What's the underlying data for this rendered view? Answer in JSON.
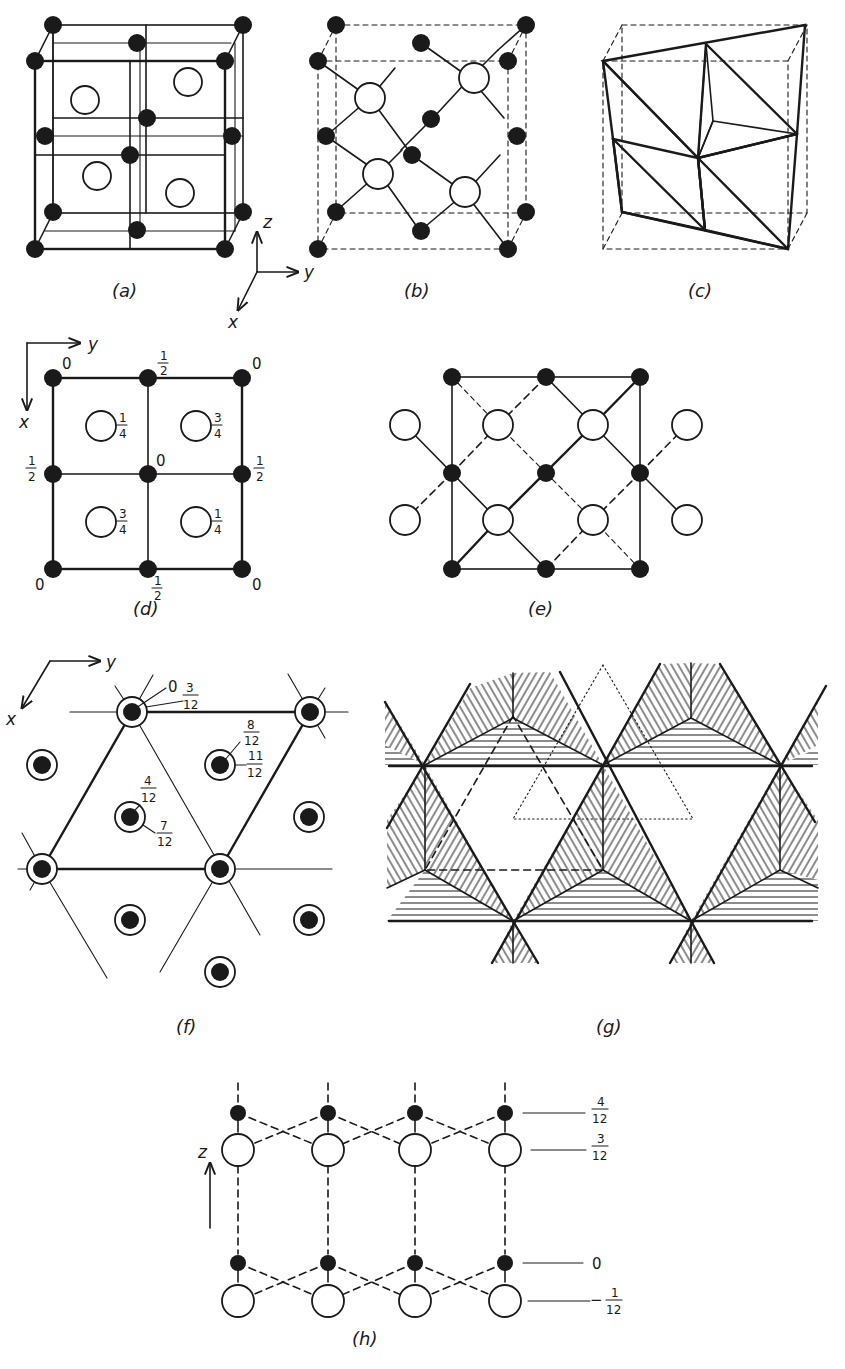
{
  "figure": {
    "panels": {
      "a": {
        "caption": "(a)",
        "description": "Sphalerite (zinc blende) cubic unit cell with filled and open atoms"
      },
      "b": {
        "caption": "(b)",
        "description": "Tetrahedral bonding within cubic cell (dashed cell edges)"
      },
      "c": {
        "caption": "(c)",
        "description": "Linked tetrahedra (stippled) within cubic cell"
      },
      "d": {
        "caption": "(d)",
        "description": "Plan projection with heights",
        "corner_heights": {
          "tl": "0",
          "tr": "0",
          "bl": "0",
          "br": "0"
        },
        "edge_heights": {
          "top": "1/2",
          "bottom": "1/2",
          "left": "1/2",
          "right": "1/2"
        },
        "center_height": "0",
        "open_atom_heights": {
          "tl": "1/4",
          "tr": "3/4",
          "bl": "3/4",
          "br": "1/4"
        }
      },
      "e": {
        "caption": "(e)",
        "description": "Projection of bonding network"
      },
      "f": {
        "caption": "(f)",
        "description": "Hexagonal projection with heights in twelfths",
        "labels": {
          "top_atom_a": "0",
          "top_atom_b": "3/12",
          "right_atom_a": "8/12",
          "right_atom_b": "11/12",
          "center_atom_a": "4/12",
          "center_atom_b": "7/12"
        }
      },
      "g": {
        "caption": "(g)",
        "description": "Tetrahedral layers, hatched, with dashed and dotted triangles"
      },
      "h": {
        "caption": "(h)",
        "description": "Side view of layer stacking along z",
        "levels": [
          {
            "num": "4",
            "den": "12",
            "prefix": ""
          },
          {
            "num": "3",
            "den": "12",
            "prefix": ""
          },
          {
            "value": "0"
          },
          {
            "num": "1",
            "den": "12",
            "prefix": "−"
          }
        ]
      }
    },
    "axes": {
      "a": {
        "z": "z",
        "y": "y",
        "x": "x"
      },
      "d": {
        "y": "y",
        "x": "x"
      },
      "f": {
        "y": "y",
        "x": "x"
      },
      "h": {
        "z": "z"
      }
    },
    "colors": {
      "ink": "#1a1a1a",
      "paper": "#ffffff",
      "stipple": "#bdbdbd"
    }
  }
}
